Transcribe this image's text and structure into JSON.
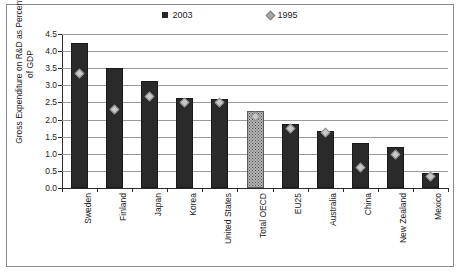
{
  "chart_data": {
    "type": "bar",
    "title": "",
    "xlabel": "",
    "ylabel": "Gross Expenditure on R&D as Percentage of GDP",
    "ylim": [
      0.0,
      4.5
    ],
    "yticks": [
      "0.0",
      "0.5",
      "1.0",
      "1.5",
      "2.0",
      "2.5",
      "3.0",
      "3.5",
      "4.0",
      "4.5"
    ],
    "ytick_values": [
      0.0,
      0.5,
      1.0,
      1.5,
      2.0,
      2.5,
      3.0,
      3.5,
      4.0,
      4.5
    ],
    "grid": true,
    "legend_position": "top-center",
    "categories": [
      "Sweden",
      "Finland",
      "Japan",
      "Korea",
      "United States",
      "Total OECD",
      "EU25",
      "Australia",
      "China",
      "New Zealand",
      "Mexico"
    ],
    "series": [
      {
        "name": "2003",
        "marker": "bar",
        "color": "#2a2a2a",
        "values": [
          4.25,
          3.5,
          3.14,
          2.64,
          2.6,
          2.26,
          1.86,
          1.68,
          1.32,
          1.19,
          0.43
        ]
      },
      {
        "name": "1995",
        "marker": "diamond",
        "color": "#c9c9c9",
        "values": [
          3.34,
          2.28,
          2.68,
          2.51,
          2.51,
          2.1,
          1.73,
          1.62,
          0.6,
          0.97,
          0.33
        ]
      }
    ],
    "highlighted_category": "Total OECD",
    "highlight_note": "Total OECD bar drawn with dotted/shaded fill"
  },
  "legend": {
    "items": [
      {
        "label": "2003",
        "glyph": "filled-square-icon"
      },
      {
        "label": "1995",
        "glyph": "diamond-icon"
      }
    ]
  }
}
